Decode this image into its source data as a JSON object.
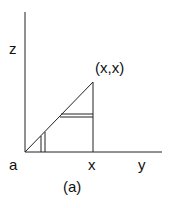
{
  "diagram": {
    "labels": {
      "z_axis": "z",
      "point": "(x,x)",
      "origin": "a",
      "x_tick": "x",
      "y_axis": "y",
      "caption": "(a)"
    },
    "colors": {
      "line": "#222222"
    }
  }
}
